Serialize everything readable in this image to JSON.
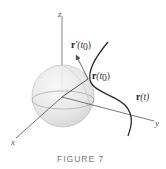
{
  "figure": {
    "caption": "FIGURE 7",
    "axes": {
      "x": "x",
      "y": "y",
      "z": "z"
    },
    "labels": {
      "tangent_bold": "r",
      "tangent_rest": "′(t",
      "tangent_sub": "0",
      "tangent_close": ")",
      "point_bold": "r",
      "point_rest": "(t",
      "point_sub": "0",
      "point_close": ")",
      "curve_bold": "r",
      "curve_rest": "(t)"
    },
    "colors": {
      "axis": "#555555",
      "curve": "#333333",
      "sphere_fill": "#e6e6e6",
      "sphere_stroke": "#bdbdbd",
      "caption": "#777777"
    }
  }
}
